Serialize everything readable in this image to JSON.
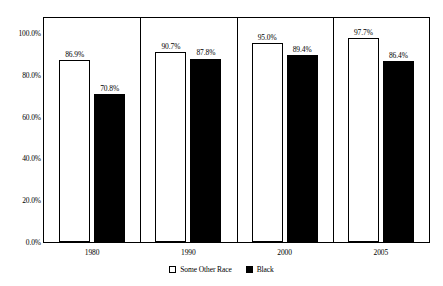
{
  "chart_data": {
    "type": "bar",
    "title": "",
    "subtitle": "",
    "xlabel": "",
    "ylabel": "",
    "categories": [
      "1980",
      "1990",
      "2000",
      "2005"
    ],
    "series": [
      {
        "name": "Some Other Race",
        "color": "#ffffff",
        "values": [
          86.9,
          90.7,
          95.0,
          97.7
        ],
        "labels": [
          "86.9%",
          "90.7%",
          "95.0%",
          "97.7%"
        ]
      },
      {
        "name": "Black",
        "color": "#000000",
        "values": [
          70.8,
          87.8,
          89.4,
          86.4
        ],
        "labels": [
          "70.8%",
          "87.8%",
          "89.4%",
          "86.4%"
        ]
      }
    ],
    "ylim": [
      0,
      100
    ],
    "ytick_values": [
      100.0,
      80.0,
      60.0,
      40.0,
      20.0,
      0.0
    ],
    "ytick_labels": [
      "100.0%",
      "80.0%",
      "60.0%",
      "40.0%",
      "20.0%",
      "0.0%"
    ],
    "grid": false,
    "legend_position": "bottom",
    "frame": true,
    "value_labels_shown": true
  },
  "legend": {
    "items": [
      {
        "label": "Some Other Race"
      },
      {
        "label": "Black"
      }
    ]
  },
  "colors": {
    "axis": "#000000",
    "text": "#000000",
    "background": "#ffffff",
    "series_some_other_race": "#ffffff",
    "series_black": "#000000"
  }
}
